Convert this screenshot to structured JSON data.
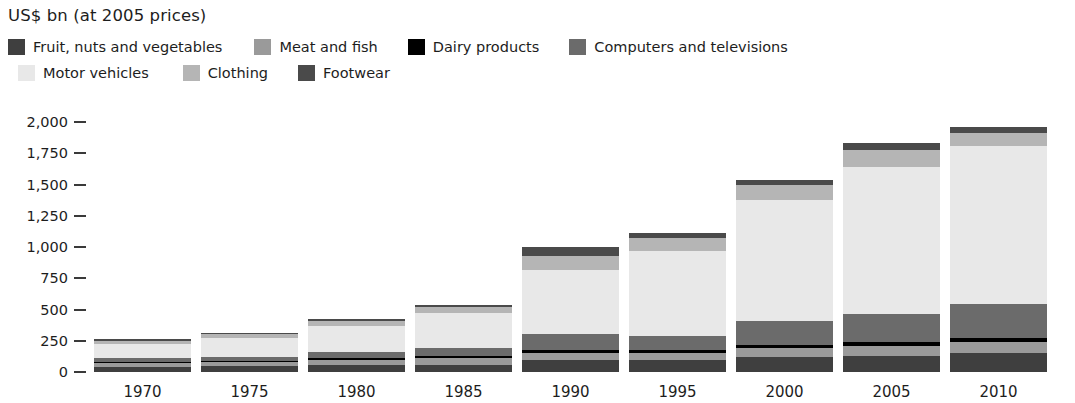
{
  "axis_title": "US$ bn (at 2005 prices)",
  "legend": {
    "rows": [
      [
        {
          "label": "Fruit, nuts and vegetables",
          "color": "#3f3f3f"
        },
        {
          "label": "Meat and fish",
          "color": "#9a9a9a"
        },
        {
          "label": "Dairy products",
          "color": "#000000"
        },
        {
          "label": "Computers and televisions",
          "color": "#6b6b6b"
        }
      ],
      [
        {
          "label": "Motor vehicles",
          "color": "#e8e8e8"
        },
        {
          "label": "Clothing",
          "color": "#b5b5b5"
        },
        {
          "label": "Footwear",
          "color": "#4a4a4a"
        }
      ]
    ]
  },
  "y_axis": {
    "ticks": [
      "2,000",
      "1,750",
      "1,500",
      "1,250",
      "1,000",
      "750",
      "500",
      "250",
      "0"
    ],
    "tick_values": [
      2000,
      1750,
      1500,
      1250,
      1000,
      750,
      500,
      250,
      0
    ]
  },
  "chart_data": {
    "type": "bar",
    "stacked": true,
    "title": "",
    "subtitle": "",
    "xlabel": "",
    "ylabel": "US$ bn (at 2005 prices)",
    "ylim": [
      0,
      2000
    ],
    "ytick_step": 250,
    "grid": false,
    "legend_position": "top",
    "categories": [
      "1970",
      "1975",
      "1980",
      "1985",
      "1990",
      "1995",
      "2000",
      "2005",
      "2010"
    ],
    "series": [
      {
        "name": "Fruit, nuts and vegetables",
        "color": "#3f3f3f",
        "values": [
          40,
          45,
          55,
          60,
          95,
          95,
          120,
          130,
          150
        ]
      },
      {
        "name": "Meat and fish",
        "color": "#9a9a9a",
        "values": [
          30,
          35,
          45,
          50,
          60,
          60,
          70,
          80,
          90
        ]
      },
      {
        "name": "Dairy products",
        "color": "#000000",
        "values": [
          12,
          12,
          15,
          18,
          22,
          20,
          25,
          28,
          32
        ]
      },
      {
        "name": "Computers and televisions",
        "color": "#6b6b6b",
        "values": [
          28,
          32,
          45,
          62,
          130,
          110,
          190,
          230,
          270
        ]
      },
      {
        "name": "Motor vehicles",
        "color": "#e8e8e8",
        "values": [
          115,
          150,
          210,
          280,
          510,
          680,
          970,
          1175,
          1270
        ]
      },
      {
        "name": "Clothing",
        "color": "#b5b5b5",
        "values": [
          25,
          30,
          40,
          50,
          115,
          110,
          125,
          135,
          100
        ]
      },
      {
        "name": "Footwear",
        "color": "#4a4a4a",
        "values": [
          10,
          11,
          15,
          20,
          68,
          35,
          40,
          52,
          48
        ]
      }
    ],
    "totals": [
      260,
      315,
      425,
      540,
      1000,
      1110,
      1540,
      1830,
      1960
    ]
  },
  "page_tail": ""
}
